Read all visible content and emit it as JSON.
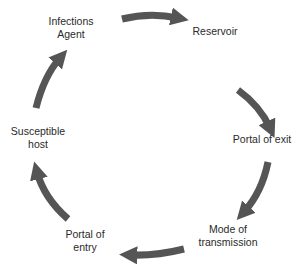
{
  "diagram": {
    "type": "cycle",
    "direction": "clockwise",
    "arrow_color": "#555555",
    "text_color": "#2a2a2a",
    "nodes": [
      {
        "id": "infectious-agent",
        "line1": "Infections",
        "line2": "Agent"
      },
      {
        "id": "reservoir",
        "line1": "Reservoir",
        "line2": ""
      },
      {
        "id": "portal-of-exit",
        "line1": "Portal of exit",
        "line2": ""
      },
      {
        "id": "mode-of-transmission",
        "line1": "Mode of",
        "line2": "transmission"
      },
      {
        "id": "portal-of-entry",
        "line1": "Portal of",
        "line2": "entry"
      },
      {
        "id": "susceptible-host",
        "line1": "Susceptible",
        "line2": "host"
      }
    ],
    "edges": [
      {
        "from": "infectious-agent",
        "to": "reservoir"
      },
      {
        "from": "reservoir",
        "to": "portal-of-exit"
      },
      {
        "from": "portal-of-exit",
        "to": "mode-of-transmission"
      },
      {
        "from": "mode-of-transmission",
        "to": "portal-of-entry"
      },
      {
        "from": "portal-of-entry",
        "to": "susceptible-host"
      },
      {
        "from": "susceptible-host",
        "to": "infectious-agent"
      }
    ]
  }
}
